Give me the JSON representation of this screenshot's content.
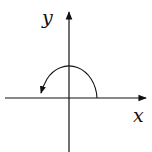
{
  "diagram": {
    "type": "coordinate-plane-rotation",
    "labels": {
      "x_axis": "x",
      "y_axis": "y"
    },
    "axes": {
      "origin": [
        69,
        98
      ],
      "x_axis": {
        "from": [
          5,
          98
        ],
        "to": [
          146,
          98
        ],
        "arrow": "right"
      },
      "y_axis": {
        "from": [
          69,
          152
        ],
        "to": [
          69,
          12
        ],
        "arrow": "up"
      }
    },
    "arc": {
      "description": "Counterclockwise semicircular arc from positive x-axis over the top to the negative x side",
      "start": [
        97,
        98
      ],
      "peak": [
        69,
        64
      ],
      "end": [
        40,
        93
      ],
      "direction": "counterclockwise",
      "arrow_at": "end"
    },
    "colors": {
      "stroke": "#111111",
      "background": "#ffffff"
    }
  }
}
